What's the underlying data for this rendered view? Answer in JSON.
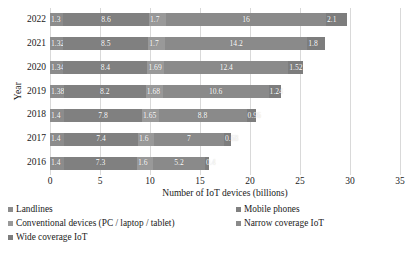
{
  "chart_data": {
    "type": "bar",
    "orientation": "horizontal",
    "stacked": true,
    "title": "",
    "xlabel": "Number of IoT devices (billions)",
    "ylabel": "Year",
    "xlim": [
      0,
      35
    ],
    "xticks": [
      0,
      5,
      10,
      15,
      20,
      25,
      30,
      35
    ],
    "grid": true,
    "legend_position": "bottom",
    "categories": [
      "2022",
      "2021",
      "2020",
      "2019",
      "2018",
      "2017",
      "2016"
    ],
    "series": [
      {
        "name": "Landlines",
        "color": "#8c8c8c",
        "values": [
          1.3,
          1.32,
          1.34,
          1.38,
          1.4,
          1.4,
          1.4
        ],
        "labels": [
          "1.3",
          "1.32",
          "1.34",
          "1.38",
          "1.4",
          "1.4",
          "1.4"
        ]
      },
      {
        "name": "Mobile phones",
        "color": "#808080",
        "values": [
          8.6,
          8.5,
          8.4,
          8.2,
          7.8,
          7.4,
          7.3
        ],
        "labels": [
          "8.6",
          "8.5",
          "8.4",
          "8.2",
          "7.8",
          "7.4",
          "7.3"
        ]
      },
      {
        "name": "Conventional devices (PC / laptop / tablet)",
        "color": "#999999",
        "values": [
          1.7,
          1.7,
          1.69,
          1.68,
          1.65,
          1.6,
          1.6
        ],
        "labels": [
          "1.7",
          "1.7",
          "1.69",
          "1.68",
          "1.65",
          "1.6",
          "1.6"
        ]
      },
      {
        "name": "Narrow coverage IoT",
        "color": "#8a8a8a",
        "values": [
          16,
          14.2,
          12.4,
          10.6,
          8.8,
          7,
          5.2
        ],
        "labels": [
          "16",
          "14.2",
          "12.4",
          "10.6",
          "8.8",
          "7",
          "5.2"
        ]
      },
      {
        "name": "Wide coverage IoT",
        "color": "#7d7d7d",
        "values": [
          2.1,
          1.8,
          1.52,
          1.24,
          0.96,
          0.68,
          0.4
        ],
        "labels": [
          "2.1",
          "1.8",
          "1.52",
          "1.24",
          "0.96",
          "0.68",
          "0.4"
        ]
      }
    ]
  },
  "axes": {
    "y_title": "Year",
    "x_title": "Number of IoT devices (billions)",
    "y_tick_labels": [
      "2022",
      "2021",
      "2020",
      "2019",
      "2018",
      "2017",
      "2016"
    ],
    "x_tick_labels": [
      "0",
      "5",
      "10",
      "15",
      "20",
      "25",
      "30",
      "35"
    ]
  },
  "legend": {
    "rows": [
      {
        "left": "Landlines",
        "right": "Mobile phones"
      },
      {
        "left": "Conventional devices (PC / laptop / tablet)",
        "right": "Narrow coverage IoT"
      },
      {
        "left": "Wide coverage IoT",
        "right": ""
      }
    ]
  },
  "colors": {
    "gridline": "#d9d9d9",
    "axis": "#a6a6a6",
    "bar_default": "#8c8c8c",
    "label_text": "#ffffff"
  }
}
